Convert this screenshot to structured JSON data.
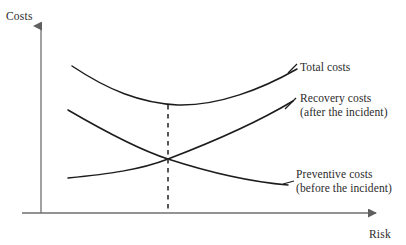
{
  "figure": {
    "type": "line-diagram",
    "title": "",
    "background_color": "#ffffff",
    "axes": {
      "y_axis_label": "Costs",
      "x_axis_label": "Risk",
      "axis_color": "#6b6b6b",
      "y_axis_x": 41,
      "x_axis_y": 213,
      "y_axis_top": 20,
      "x_axis_right": 385,
      "arrowheads": true,
      "tick_labels_x": [],
      "tick_labels_y": [],
      "grid": false
    },
    "curves": [
      {
        "name": "total-costs",
        "label": "Total costs",
        "label_line1": "Total costs",
        "label_line2": "",
        "color": "#1a1a1a",
        "shape": "u-curve",
        "points": [
          [
            72,
            66
          ],
          [
            110,
            86
          ],
          [
            145,
            99
          ],
          [
            175,
            105
          ],
          [
            205,
            104
          ],
          [
            240,
            95
          ],
          [
            270,
            82
          ],
          [
            297,
            69
          ]
        ]
      },
      {
        "name": "recovery-costs",
        "label": "Recovery costs (after the incident)",
        "label_line1": "Recovery costs",
        "label_line2": "(after the incident)",
        "color": "#1a1a1a",
        "shape": "increasing-convex",
        "points": [
          [
            68,
            178
          ],
          [
            100,
            174
          ],
          [
            135,
            168
          ],
          [
            168,
            159
          ],
          [
            205,
            146
          ],
          [
            240,
            131
          ],
          [
            270,
            116
          ],
          [
            293,
            102
          ]
        ]
      },
      {
        "name": "preventive-costs",
        "label": "Preventive costs (before the incident)",
        "label_line1": "Preventive costs",
        "label_line2": "(before the incident)",
        "color": "#1a1a1a",
        "shape": "decreasing-convex",
        "points": [
          [
            68,
            110
          ],
          [
            95,
            124
          ],
          [
            125,
            141
          ],
          [
            150,
            152
          ],
          [
            168,
            159
          ],
          [
            200,
            169
          ],
          [
            235,
            177
          ],
          [
            262,
            182
          ],
          [
            288,
            185
          ]
        ]
      }
    ],
    "intersection": {
      "name": "optimum-point",
      "x": 168,
      "y": 159,
      "dashed_line": true,
      "dash_color": "#3a3a3a",
      "dash_from_y": 105,
      "dash_to_y": 213
    },
    "leader_lines": [
      {
        "name": "total-costs-leader",
        "from": [
          288,
          72
        ],
        "to": [
          297,
          65
        ]
      },
      {
        "name": "recovery-costs-leader",
        "from": [
          284,
          108
        ],
        "to": [
          296,
          98
        ]
      },
      {
        "name": "preventive-costs-leader",
        "from": [
          284,
          184
        ],
        "to": [
          294,
          181
        ]
      }
    ]
  },
  "labels": {
    "costs": "Costs",
    "risk": "Risk",
    "total_costs": "Total costs",
    "recovery_costs_line1": "Recovery costs",
    "recovery_costs_line2": "(after the incident)",
    "preventive_costs_line1": "Preventive costs",
    "preventive_costs_line2": "(before the incident)"
  }
}
